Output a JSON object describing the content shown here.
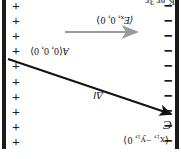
{
  "figure": {
    "orientation_degrees": 180,
    "cropped_caption_fragment": "K or 3r",
    "colors": {
      "plate": "#1a1a1a",
      "charge_symbol": "#1a1a1a",
      "displacement_vector": "#111111",
      "field_vector": "#9a9a9a",
      "label_text": "#141414",
      "background": "#ffffff"
    },
    "plates": {
      "negative": {
        "name": "negative-plate",
        "symbol": "−",
        "count": 10,
        "side": "left"
      },
      "positive": {
        "name": "positive-plate",
        "symbol": "+",
        "count": 10,
        "side": "right"
      }
    },
    "labels": {
      "point_c_name": "C",
      "point_c_coords": "⟨x₁, −y₁, 0⟩",
      "point_c_coords_parts": {
        "open": "⟨",
        "x": "x",
        "x_sub": "1",
        "y": "−y",
        "y_sub": "1",
        "z": "0",
        "close": "⟩"
      },
      "point_a_name": "A",
      "point_a_coords": "⟨0, 0, 0⟩",
      "displacement_vector": "Δl",
      "field_vector": "⟨E",
      "field_vector_sub": "x",
      "field_vector_rest": ", 0, 0⟩"
    }
  }
}
